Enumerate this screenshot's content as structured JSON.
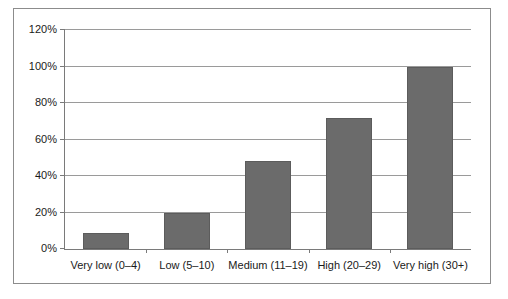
{
  "chart_data": {
    "type": "bar",
    "title": "",
    "xlabel": "",
    "ylabel": "",
    "categories": [
      "Very low (0–4)",
      "Low (5–10)",
      "Medium (11–19)",
      "High (20–29)",
      "Very high (30+)"
    ],
    "values": [
      9,
      20,
      48,
      72,
      100
    ],
    "value_labels": [
      "9%",
      "20%",
      "48%",
      "72%",
      "100%"
    ],
    "ylim": [
      0,
      120
    ],
    "ytick_labels": [
      "0%",
      "20%",
      "40%",
      "60%",
      "80%",
      "100%",
      "120%"
    ],
    "ytick_values": [
      0,
      20,
      40,
      60,
      80,
      100,
      120
    ],
    "grid": true,
    "legend": false,
    "colors": {
      "bar_fill": "#6b6b6b",
      "bar_border": "#5c5c5c",
      "gridline": "#9a9a9a",
      "axis": "#7a7a7a",
      "frame": "#8c8c8c",
      "background": "#ffffff",
      "text": "#1a1a1a"
    }
  }
}
